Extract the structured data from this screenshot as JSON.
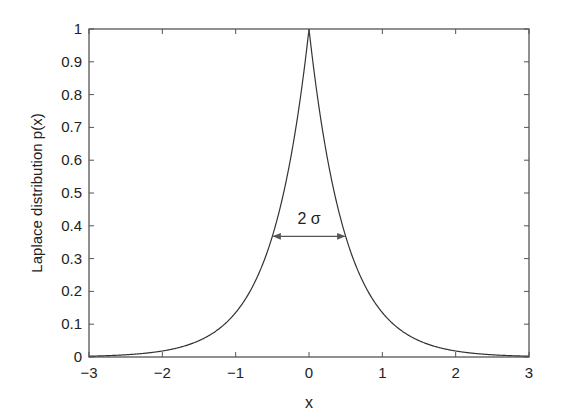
{
  "chart_data": {
    "type": "line",
    "title": "",
    "xlabel": "x",
    "ylabel": "Laplace distribution p(x)",
    "xlim": [
      -3,
      3
    ],
    "ylim": [
      0,
      1
    ],
    "xticks": [
      -3,
      -2,
      -1,
      0,
      1,
      2,
      3
    ],
    "xtick_labels": [
      "−3",
      "−2",
      "−1",
      "0",
      "1",
      "2",
      "3"
    ],
    "yticks": [
      0,
      0.1,
      0.2,
      0.3,
      0.4,
      0.5,
      0.6,
      0.7,
      0.8,
      0.9,
      1
    ],
    "ytick_labels": [
      "0",
      "0.1",
      "0.2",
      "0.3",
      "0.4",
      "0.5",
      "0.6",
      "0.7",
      "0.8",
      "0.9",
      "1"
    ],
    "grid": false,
    "legend": null,
    "series": [
      {
        "name": "p(x) = exp(-2|x|)",
        "color": "#333333",
        "x": [
          -3,
          -2.5,
          -2,
          -1.5,
          -1,
          -0.75,
          -0.5,
          -0.25,
          0,
          0.25,
          0.5,
          0.75,
          1,
          1.5,
          2,
          2.5,
          3
        ],
        "y": [
          0.0025,
          0.0067,
          0.0183,
          0.0498,
          0.1353,
          0.2231,
          0.3679,
          0.6065,
          1.0,
          0.6065,
          0.3679,
          0.2231,
          0.1353,
          0.0498,
          0.0183,
          0.0067,
          0.0025
        ]
      }
    ],
    "annotations": [
      {
        "type": "double-arrow",
        "label": "2 σ",
        "x_from": -0.5,
        "x_to": 0.5,
        "y": 0.368
      }
    ]
  },
  "labels": {
    "xlabel": "x",
    "ylabel": "Laplace distribution p(x)",
    "annotation": "2 σ"
  },
  "colors": {
    "axis": "#555555",
    "curve": "#333333",
    "text": "#222222",
    "background": "#ffffff"
  }
}
